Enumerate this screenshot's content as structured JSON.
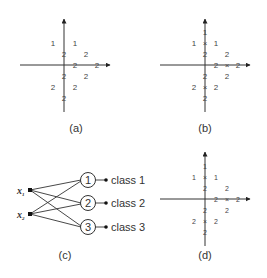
{
  "figure": {
    "panels": [
      {
        "id": "a",
        "caption": "(a)",
        "points": [
          {
            "label": "1",
            "x": -1,
            "y": 2
          },
          {
            "label": "1",
            "x": 1,
            "y": 2
          },
          {
            "label": "2",
            "x": 0,
            "y": 1
          },
          {
            "label": "2",
            "x": 2,
            "y": 1
          },
          {
            "label": "2",
            "x": 1,
            "y": 0
          },
          {
            "label": "2",
            "x": 3,
            "y": 0
          },
          {
            "label": "2",
            "x": 0,
            "y": -1
          },
          {
            "label": "2",
            "x": 2,
            "y": -1
          },
          {
            "label": "2",
            "x": -1,
            "y": -2
          },
          {
            "label": "2",
            "x": 1,
            "y": -2
          },
          {
            "label": "2",
            "x": 0,
            "y": -3
          }
        ]
      },
      {
        "id": "b",
        "caption": "(b)",
        "points": [
          {
            "label": "1",
            "x": 0,
            "y": 3
          },
          {
            "label": "1",
            "x": -1,
            "y": 2
          },
          {
            "label": "X",
            "x": 0,
            "y": 2
          },
          {
            "label": "1",
            "x": 1,
            "y": 2
          },
          {
            "label": "2",
            "x": 0,
            "y": 1
          },
          {
            "label": "2",
            "x": 2,
            "y": 1
          },
          {
            "label": "2",
            "x": 1,
            "y": 0
          },
          {
            "label": "X",
            "x": 2,
            "y": 0
          },
          {
            "label": "2",
            "x": 3,
            "y": 0
          },
          {
            "label": "2",
            "x": 0,
            "y": -1
          },
          {
            "label": "2",
            "x": 2,
            "y": -1
          },
          {
            "label": "2",
            "x": -1,
            "y": -2
          },
          {
            "label": "X",
            "x": 0,
            "y": -2
          },
          {
            "label": "2",
            "x": 1,
            "y": -2
          },
          {
            "label": "2",
            "x": 0,
            "y": -3
          }
        ]
      },
      {
        "id": "c",
        "caption": "(c)",
        "inputs": [
          "x",
          "x"
        ],
        "input_subscripts": [
          "1",
          "2"
        ],
        "nodes": [
          "1",
          "2",
          "3"
        ],
        "outputs": [
          "class 1",
          "class 2",
          "class 3"
        ]
      },
      {
        "id": "d",
        "caption": "(d)",
        "points": [
          {
            "label": "1",
            "x": 0,
            "y": 3
          },
          {
            "label": "1",
            "x": -1,
            "y": 2
          },
          {
            "label": "X",
            "x": 0,
            "y": 2
          },
          {
            "label": "1",
            "x": 1,
            "y": 2
          },
          {
            "label": "2",
            "x": 0,
            "y": 1
          },
          {
            "label": "2",
            "x": 2,
            "y": 1
          },
          {
            "label": "2",
            "x": 1,
            "y": 0
          },
          {
            "label": "X",
            "x": 2,
            "y": 0
          },
          {
            "label": "2",
            "x": 3,
            "y": 0
          },
          {
            "label": "2",
            "x": 0,
            "y": -1
          },
          {
            "label": "2",
            "x": 2,
            "y": -1
          },
          {
            "label": "2",
            "x": -1,
            "y": -2
          },
          {
            "label": "X",
            "x": 0,
            "y": -2
          },
          {
            "label": "2",
            "x": 1,
            "y": -2
          },
          {
            "label": "2",
            "x": 0,
            "y": -3
          }
        ]
      }
    ],
    "colors": {
      "ink": "#333333",
      "background": "#ffffff"
    }
  }
}
